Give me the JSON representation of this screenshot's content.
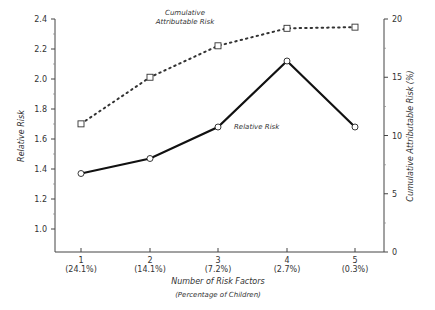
{
  "chart_data": {
    "type": "line",
    "title": "",
    "xlabel": "Number of Risk Factors",
    "xlabel_sub": "(Percentage of Children)",
    "ylabel_left": "Relative Risk",
    "ylabel_right": "Cumulative Attributable Risk (%)",
    "categories": [
      "1",
      "2",
      "3",
      "4",
      "5"
    ],
    "category_sublabels": [
      "(24.1%)",
      "(14.1%)",
      "(7.2%)",
      "(2.7%)",
      "(0.3%)"
    ],
    "ylim_left": [
      0.85,
      2.4
    ],
    "ylim_right": [
      0,
      20
    ],
    "left_ticks": [
      "1.0",
      "1.2",
      "1.4",
      "1.6",
      "1.8",
      "2.0",
      "2.2",
      "2.4"
    ],
    "right_ticks": [
      "0",
      "5",
      "10",
      "15",
      "20"
    ],
    "grid": false,
    "series": [
      {
        "name": "Relative Risk",
        "axis": "left",
        "style": "solid",
        "marker": "circle",
        "values": [
          1.37,
          1.47,
          1.68,
          2.12,
          1.68
        ]
      },
      {
        "name": "Cumulative Attributable Risk",
        "axis": "right",
        "style": "dotted",
        "marker": "square",
        "values": [
          11.0,
          15.0,
          17.7,
          19.2,
          19.3
        ]
      }
    ],
    "annotations": [
      {
        "text_line1": "Cumulative",
        "text_line2": "Attributable Risk"
      },
      {
        "text": "Relative Risk"
      }
    ]
  }
}
